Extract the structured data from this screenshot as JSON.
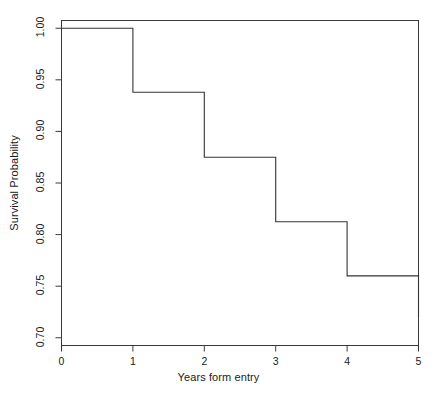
{
  "chart_data": {
    "type": "line",
    "subtype": "kaplan-meier-step",
    "title": "",
    "xlabel": "Years form entry",
    "ylabel": "Survival Probability",
    "xlim": [
      0,
      5
    ],
    "ylim": [
      0.6925,
      1.0075
    ],
    "grid": false,
    "legend": null,
    "x_ticks": [
      0,
      1,
      2,
      3,
      4,
      5
    ],
    "x_tick_labels": [
      "0",
      "1",
      "2",
      "3",
      "4",
      "5"
    ],
    "y_ticks": [
      0.7,
      0.75,
      0.8,
      0.85,
      0.9,
      0.95,
      1.0
    ],
    "y_tick_labels": [
      "0.70",
      "0.75",
      "0.80",
      "0.85",
      "0.90",
      "0.95",
      "1.00"
    ],
    "x": [
      0,
      1,
      2,
      3,
      4,
      5
    ],
    "values": [
      1.0,
      0.938,
      0.875,
      0.8125,
      0.76,
      0.72
    ],
    "series": [
      {
        "name": "Survival",
        "x": [
          0,
          1,
          2,
          3,
          4,
          5
        ],
        "values": [
          1.0,
          0.938,
          0.875,
          0.8125,
          0.76,
          0.72
        ],
        "color": "#333333"
      }
    ],
    "steps": [
      {
        "x_start": 0,
        "x_end": 1,
        "y": 1.0
      },
      {
        "x_start": 1,
        "x_end": 2,
        "y": 0.938
      },
      {
        "x_start": 2,
        "x_end": 3,
        "y": 0.875
      },
      {
        "x_start": 3,
        "x_end": 4,
        "y": 0.8125
      },
      {
        "x_start": 4,
        "x_end": 5,
        "y": 0.76
      },
      {
        "x_start": 5,
        "x_end": 5,
        "y": 0.72
      }
    ],
    "line_color": "#333333",
    "frame_color": "#3a3a3a",
    "background": "#ffffff"
  },
  "axes": {
    "x_title": "Years form entry",
    "y_title": "Survival Probability"
  }
}
